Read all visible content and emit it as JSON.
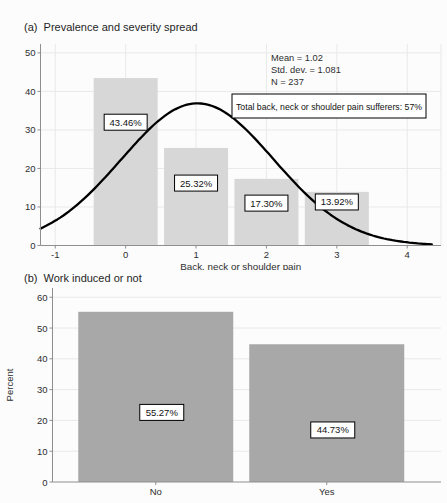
{
  "figure": {
    "bg": "#fcfcfc",
    "text_color": "#2e2e2e",
    "axis_color": "#8f8f8f",
    "grid_color": "#e9e9e9",
    "label_box_fill": "#ffffff",
    "label_box_border": "#000000"
  },
  "chart_data": [
    {
      "type": "bar",
      "variant": "histogram-with-normal-curve",
      "title": "(a)  Prevalence and severity spread",
      "xlabel": "Back, neck or shoulder pain",
      "ylabel": "",
      "categories": [
        0,
        1,
        2,
        3
      ],
      "values": [
        43.46,
        25.32,
        17.3,
        13.92
      ],
      "bar_labels": [
        "43.46%",
        "25.32%",
        "17.30%",
        "13.92%"
      ],
      "label_anchor_values": [
        32,
        16.2,
        11,
        11.3
      ],
      "xticks": [
        -1,
        0,
        1,
        2,
        3,
        4
      ],
      "yticks": [
        0,
        10,
        20,
        30,
        40,
        50
      ],
      "xlim": [
        -1.21,
        4.48
      ],
      "ylim": [
        0,
        52.3
      ],
      "grid": true,
      "legend": null,
      "bar_color": "#d7d7d7",
      "curve": {
        "shape": "normal",
        "mean": 1.02,
        "sd": 1.081,
        "peak_height": 36.9,
        "x_start": -1.21,
        "x_end": 4.37,
        "color": "#000000"
      },
      "stats_lines": [
        "Mean = 1.02",
        "Std. dev. = 1.081",
        "N = 237"
      ],
      "annotation": "Total back, neck or shoulder pain sufferers: 57%"
    },
    {
      "type": "bar",
      "title": "(b)  Work induced or not",
      "xlabel": "",
      "ylabel": "Percent",
      "categories": [
        "No",
        "Yes"
      ],
      "values": [
        55.27,
        44.73
      ],
      "bar_labels": [
        "55.27%",
        "44.73%"
      ],
      "label_anchor_values": [
        22.6,
        16.9
      ],
      "yticks": [
        0,
        10,
        20,
        30,
        40,
        50,
        60
      ],
      "ylim": [
        0,
        63
      ],
      "grid": true,
      "legend": null,
      "bar_color": "#a8a8a8"
    }
  ]
}
